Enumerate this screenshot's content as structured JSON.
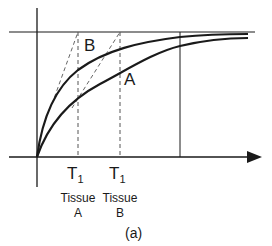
{
  "figure": {
    "caption": "(a)",
    "curves": [
      {
        "label": "B",
        "description": "faster-recovering curve (Tissue B? labeled B, shorter T1)"
      },
      {
        "label": "A",
        "description": "slower-recovering curve"
      }
    ],
    "markers": [
      {
        "symbol": "T",
        "subscript": "1",
        "tissue_line1": "Tissue",
        "tissue_line2": "A"
      },
      {
        "symbol": "T",
        "subscript": "1",
        "tissue_line1": "Tissue",
        "tissue_line2": "B"
      }
    ],
    "colors": {
      "line": "#1a1a1a",
      "dashed": "#555555",
      "background": "#ffffff"
    }
  }
}
